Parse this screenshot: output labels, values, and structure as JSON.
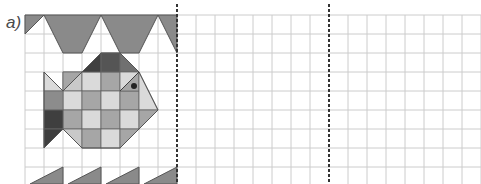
{
  "exercise": {
    "label": "a)",
    "grid": {
      "origin_x": 25,
      "origin_y": 15,
      "cell": 19,
      "cols": 24,
      "rows": 9,
      "line_color": "#c8c8c8"
    },
    "dividers": [
      {
        "x": 177
      },
      {
        "x": 329
      }
    ],
    "colors": {
      "dark": "#3f3f3f",
      "mid": "#8c8c8c",
      "mid2": "#a6a6a6",
      "light": "#c9c9c9",
      "lighter": "#dadada",
      "outline": "#555555"
    },
    "panels": [
      "pattern-with-fish",
      "empty-grid",
      "empty-grid"
    ]
  }
}
